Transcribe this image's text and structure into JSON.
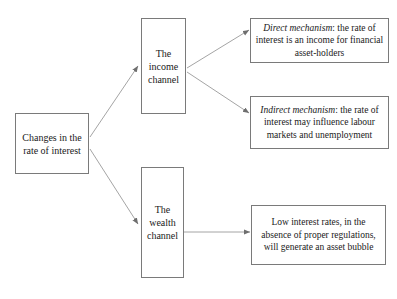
{
  "diagram": {
    "title_visible": false,
    "background_color": "#ffffff",
    "box_border_color": "#7a7a7a",
    "arrow_color": "#8a8a8a",
    "text_color": "#1a1a1a",
    "nodes": {
      "changes": {
        "label": "Changes in the rate of interest"
      },
      "income": {
        "label": "The income channel"
      },
      "wealth": {
        "label": "The wealth channel"
      },
      "direct": {
        "lead": "Direct mechanism",
        "rest": ": the rate of interest is an income for financial asset-holders"
      },
      "indirect": {
        "lead": "Indirect mechanism",
        "rest": ": the rate of interest may influence labour markets and unemployment"
      },
      "bubble": {
        "label": "Low interest rates, in the absence of proper regulations, will generate an asset bubble"
      }
    },
    "edges": [
      {
        "name": "changes-to-income",
        "from": "changes",
        "to": "income",
        "style": "diagonal-up"
      },
      {
        "name": "changes-to-wealth",
        "from": "changes",
        "to": "wealth",
        "style": "diagonal-down"
      },
      {
        "name": "income-to-direct",
        "from": "income",
        "to": "direct",
        "style": "diagonal-up"
      },
      {
        "name": "income-to-indirect",
        "from": "income",
        "to": "indirect",
        "style": "diagonal-down"
      },
      {
        "name": "wealth-to-bubble",
        "from": "wealth",
        "to": "bubble",
        "style": "horizontal"
      }
    ]
  }
}
